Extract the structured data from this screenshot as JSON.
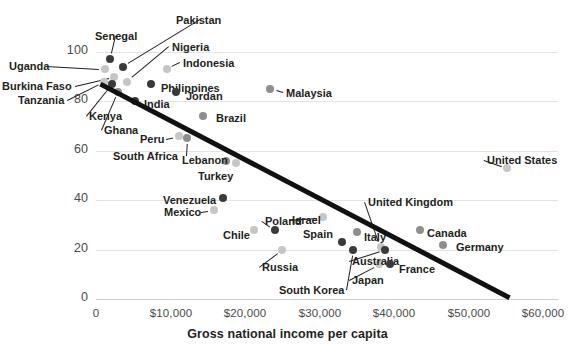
{
  "chart_data": {
    "type": "scatter",
    "title": "",
    "xlabel": "Gross national income per capita",
    "ylabel": "",
    "xlim": [
      0,
      62000
    ],
    "ylim": [
      0,
      110
    ],
    "grid": true,
    "legend": "none",
    "xticks": [
      "0",
      "$10,000",
      "$20,000",
      "$30,000",
      "$40,000",
      "$50,000",
      "$60,000"
    ],
    "xtick_values": [
      0,
      10000,
      20000,
      30000,
      40000,
      50000,
      60000
    ],
    "yticks": [
      "0",
      "20",
      "40",
      "60",
      "80",
      "100"
    ],
    "ytick_values": [
      0,
      20,
      40,
      60,
      80,
      100
    ],
    "trendline": {
      "x_start": 600,
      "y_start": 87,
      "x_end": 55500,
      "y_end": 0.5
    },
    "points": [
      {
        "label": "Senegal",
        "x": 1900,
        "y": 97,
        "shade": "dark",
        "lx": 95,
        "ly": 30,
        "anchor": "middle"
      },
      {
        "label": "Pakistan",
        "x": 3600,
        "y": 94,
        "shade": "dark",
        "lx": 176,
        "ly": 14,
        "anchor": "middle"
      },
      {
        "label": "Nigeria",
        "x": 4200,
        "y": 88,
        "shade": "light",
        "lx": 172,
        "ly": 41,
        "anchor": "start"
      },
      {
        "label": "Uganda",
        "x": 1250,
        "y": 93,
        "shade": "light",
        "lx": 9,
        "ly": 60,
        "anchor": "start"
      },
      {
        "label": "Burkina Faso",
        "x": 2450,
        "y": 90,
        "shade": "light",
        "lx": 2,
        "ly": 80,
        "anchor": "start"
      },
      {
        "label": "Tanzania",
        "x": 1100,
        "y": 88,
        "shade": "light",
        "lx": 18,
        "ly": 94,
        "anchor": "start"
      },
      {
        "label": "Kenya",
        "x": 2100,
        "y": 87,
        "shade": "dark",
        "lx": 89,
        "ly": 110,
        "anchor": "start"
      },
      {
        "label": "Ghana",
        "x": 2900,
        "y": 84,
        "shade": "mid",
        "lx": 104,
        "ly": 124,
        "anchor": "start"
      },
      {
        "label": "India",
        "x": 5200,
        "y": 80,
        "shade": "dark",
        "lx": 144,
        "ly": 98,
        "anchor": "start"
      },
      {
        "label": "Indonesia",
        "x": 9500,
        "y": 93,
        "shade": "light",
        "lx": 183,
        "ly": 57,
        "anchor": "start"
      },
      {
        "label": "Philippines",
        "x": 7400,
        "y": 87,
        "shade": "dark",
        "lx": 161,
        "ly": 82,
        "anchor": "start"
      },
      {
        "label": "Jordan",
        "x": 10700,
        "y": 84,
        "shade": "dark",
        "lx": 186,
        "ly": 90,
        "anchor": "start"
      },
      {
        "label": "Malaysia",
        "x": 23400,
        "y": 85,
        "shade": "mid",
        "lx": 286,
        "ly": 87,
        "anchor": "start"
      },
      {
        "label": "Brazil",
        "x": 14400,
        "y": 74,
        "shade": "mid",
        "lx": 216,
        "ly": 112,
        "anchor": "start"
      },
      {
        "label": "Peru",
        "x": 11100,
        "y": 66,
        "shade": "light",
        "lx": 140,
        "ly": 133,
        "anchor": "start"
      },
      {
        "label": "South Africa",
        "x": 12200,
        "y": 65,
        "shade": "mid",
        "lx": 113,
        "ly": 150,
        "anchor": "start"
      },
      {
        "label": "Lebanon",
        "x": 17400,
        "y": 56,
        "shade": "mid",
        "lx": 182,
        "ly": 154,
        "anchor": "start"
      },
      {
        "label": "Turkey",
        "x": 18800,
        "y": 55,
        "shade": "light",
        "lx": 198,
        "ly": 170,
        "anchor": "start"
      },
      {
        "label": "Venezuela",
        "x": 17000,
        "y": 41,
        "shade": "dark",
        "lx": 163,
        "ly": 194,
        "anchor": "start"
      },
      {
        "label": "Mexico",
        "x": 15900,
        "y": 36,
        "shade": "light",
        "lx": 164,
        "ly": 206,
        "anchor": "start"
      },
      {
        "label": "Poland",
        "x": 24000,
        "y": 28,
        "shade": "dark",
        "lx": 265,
        "ly": 215,
        "anchor": "start"
      },
      {
        "label": "Chile",
        "x": 21200,
        "y": 28,
        "shade": "light",
        "lx": 223,
        "ly": 229,
        "anchor": "start"
      },
      {
        "label": "Israel",
        "x": 30400,
        "y": 33,
        "shade": "light",
        "lx": 292,
        "ly": 214,
        "anchor": "start"
      },
      {
        "label": "Italy",
        "x": 35000,
        "y": 27,
        "shade": "mid",
        "lx": 364,
        "ly": 231,
        "anchor": "start"
      },
      {
        "label": "Spain",
        "x": 33000,
        "y": 23,
        "shade": "dark",
        "lx": 303,
        "ly": 228,
        "anchor": "start"
      },
      {
        "label": "Russia",
        "x": 25000,
        "y": 20,
        "shade": "light",
        "lx": 262,
        "ly": 261,
        "anchor": "start"
      },
      {
        "label": "South Korea",
        "x": 34500,
        "y": 20,
        "shade": "dark",
        "lx": 279,
        "ly": 284,
        "anchor": "start"
      },
      {
        "label": "Japan",
        "x": 38000,
        "y": 14,
        "shade": "light",
        "lx": 352,
        "ly": 274,
        "anchor": "start"
      },
      {
        "label": "United Kingdom",
        "x": 38200,
        "y": 21,
        "shade": "light",
        "lx": 368,
        "ly": 196,
        "anchor": "start"
      },
      {
        "label": "Australia",
        "x": 38800,
        "y": 20,
        "shade": "dark",
        "lx": 352,
        "ly": 255,
        "anchor": "start"
      },
      {
        "label": "France",
        "x": 39400,
        "y": 14,
        "shade": "dark",
        "lx": 399,
        "ly": 263,
        "anchor": "start"
      },
      {
        "label": "Canada",
        "x": 43500,
        "y": 28,
        "shade": "mid",
        "lx": 427,
        "ly": 227,
        "anchor": "start"
      },
      {
        "label": "Germany",
        "x": 46500,
        "y": 22,
        "shade": "mid",
        "lx": 456,
        "ly": 241,
        "anchor": "start"
      },
      {
        "label": "United States",
        "x": 55200,
        "y": 53,
        "shade": "light",
        "lx": 487,
        "ly": 154,
        "anchor": "start"
      }
    ]
  }
}
